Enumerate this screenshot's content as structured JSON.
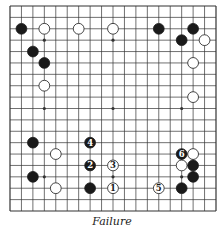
{
  "diagram": {
    "type": "go-board",
    "size": 19,
    "caption": "Failure",
    "colors": {
      "line": "#333333",
      "black": "#1a1a1a",
      "white": "#ffffff",
      "board": "#ffffff"
    },
    "star_points": [
      [
        3,
        3
      ],
      [
        9,
        3
      ],
      [
        15,
        3
      ],
      [
        3,
        9
      ],
      [
        9,
        9
      ],
      [
        15,
        9
      ],
      [
        3,
        15
      ],
      [
        9,
        15
      ],
      [
        15,
        15
      ]
    ],
    "stones": [
      {
        "col": 1,
        "row": 2,
        "color": "black"
      },
      {
        "col": 3,
        "row": 2,
        "color": "white"
      },
      {
        "col": 6,
        "row": 2,
        "color": "white"
      },
      {
        "col": 9,
        "row": 2,
        "color": "white"
      },
      {
        "col": 13,
        "row": 2,
        "color": "black"
      },
      {
        "col": 16,
        "row": 2,
        "color": "black"
      },
      {
        "col": 15,
        "row": 3,
        "color": "black"
      },
      {
        "col": 17,
        "row": 3,
        "color": "white"
      },
      {
        "col": 2,
        "row": 4,
        "color": "black"
      },
      {
        "col": 3,
        "row": 5,
        "color": "black"
      },
      {
        "col": 16,
        "row": 5,
        "color": "white"
      },
      {
        "col": 3,
        "row": 7,
        "color": "white"
      },
      {
        "col": 16,
        "row": 8,
        "color": "white"
      },
      {
        "col": 2,
        "row": 12,
        "color": "black"
      },
      {
        "col": 7,
        "row": 12,
        "color": "black",
        "label": "4"
      },
      {
        "col": 4,
        "row": 13,
        "color": "white"
      },
      {
        "col": 15,
        "row": 13,
        "color": "black",
        "label": "6"
      },
      {
        "col": 16,
        "row": 13,
        "color": "white"
      },
      {
        "col": 7,
        "row": 14,
        "color": "black",
        "label": "2"
      },
      {
        "col": 9,
        "row": 14,
        "color": "white",
        "label": "3"
      },
      {
        "col": 15,
        "row": 14,
        "color": "white"
      },
      {
        "col": 16,
        "row": 14,
        "color": "black"
      },
      {
        "col": 2,
        "row": 15,
        "color": "black"
      },
      {
        "col": 16,
        "row": 15,
        "color": "black"
      },
      {
        "col": 4,
        "row": 16,
        "color": "white"
      },
      {
        "col": 7,
        "row": 16,
        "color": "black"
      },
      {
        "col": 9,
        "row": 16,
        "color": "white",
        "label": "1"
      },
      {
        "col": 13,
        "row": 16,
        "color": "white",
        "label": "5"
      },
      {
        "col": 15,
        "row": 16,
        "color": "black"
      }
    ]
  }
}
